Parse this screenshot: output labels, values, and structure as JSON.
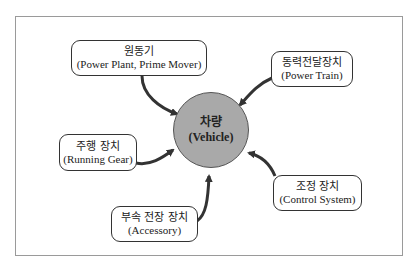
{
  "diagram": {
    "center": {
      "ko": "차량",
      "en": "(Vehicle)",
      "fill": "#a9a9a9"
    },
    "nodes": [
      {
        "id": "power-plant",
        "ko": "원동기",
        "en": "(Power Plant, Prime Mover)"
      },
      {
        "id": "power-train",
        "ko": "동력전달장치",
        "en": "(Power Train)"
      },
      {
        "id": "running-gear",
        "ko": "주행 장치",
        "en": "(Running Gear)"
      },
      {
        "id": "accessory",
        "ko": "부속 전장 장치",
        "en": "(Accessory)"
      },
      {
        "id": "control-system",
        "ko": "조정 장치",
        "en": "(Control System)"
      }
    ],
    "edges": [
      {
        "from": "power-plant",
        "to": "vehicle"
      },
      {
        "from": "power-train",
        "to": "vehicle"
      },
      {
        "from": "running-gear",
        "to": "vehicle"
      },
      {
        "from": "accessory",
        "to": "vehicle"
      },
      {
        "from": "control-system",
        "to": "vehicle"
      }
    ],
    "colors": {
      "arrow": "#333333",
      "border": "#333333",
      "frame": "#9a9a9a"
    }
  }
}
